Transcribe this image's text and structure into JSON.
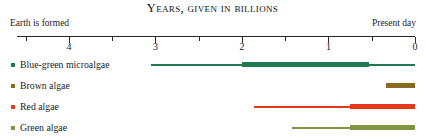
{
  "chart_data": {
    "type": "bar",
    "title": "Years, given in billions",
    "subtitle": "",
    "xlabel": "",
    "ylabel": "",
    "orientation": "horizontal-timeline",
    "xlim": [
      4.6,
      0
    ],
    "x_direction": "reversed",
    "grid": false,
    "legend_position": "left",
    "axis": {
      "left_caption": "Earth is formed",
      "right_caption": "Present day",
      "major_ticks": [
        4,
        3,
        2,
        1,
        0
      ],
      "major_tick_labels": [
        "4",
        "3",
        "2",
        "1",
        "0"
      ],
      "minor_ticks": [
        4.5,
        3.5,
        2.5,
        1.5,
        0.5
      ],
      "units": "billions of years ago"
    },
    "categories": [
      "Blue-green microalgae",
      "Brown algae",
      "Red algae",
      "Green algae"
    ],
    "series": [
      {
        "name": "possible range",
        "style": "thin",
        "values": [
          {
            "category": "Blue-green microalgae",
            "start": 3.05,
            "end": 0.0
          },
          {
            "category": "Brown algae",
            "start": null,
            "end": null
          },
          {
            "category": "Red algae",
            "start": 1.86,
            "end": 0.0
          },
          {
            "category": "Green algae",
            "start": 1.42,
            "end": 0.0
          }
        ]
      },
      {
        "name": "confirmed range",
        "style": "thick",
        "values": [
          {
            "category": "Blue-green microalgae",
            "start": 2.0,
            "end": 0.53
          },
          {
            "category": "Brown algae",
            "start": 0.33,
            "end": 0.0
          },
          {
            "category": "Red algae",
            "start": 0.75,
            "end": 0.0
          },
          {
            "category": "Green algae",
            "start": 0.75,
            "end": 0.0
          }
        ]
      }
    ],
    "colors": {
      "blue_green_microalgae": "#1f7a52",
      "brown_algae": "#8a6a21",
      "red_algae": "#e8381a",
      "green_algae": "#7f9540",
      "axis": "#2a2a2a",
      "text": "#1c1c1c"
    }
  },
  "title": "Years, given in billions",
  "axis": {
    "left_caption": "Earth is formed",
    "right_caption": "Present day",
    "labels": {
      "t4": "4",
      "t3": "3",
      "t2": "2",
      "t1": "1",
      "t0": "0"
    }
  },
  "rows": [
    {
      "label": "Blue-green microalgae",
      "color": "#1f7a52",
      "bullet": "legend-bullet-blue-green-microalgae"
    },
    {
      "label": "Brown algae",
      "color": "#8a6a21",
      "bullet": "legend-bullet-brown-algae"
    },
    {
      "label": "Red algae",
      "color": "#e8381a",
      "bullet": "legend-bullet-red-algae"
    },
    {
      "label": "Green algae",
      "color": "#7f9540",
      "bullet": "legend-bullet-green-algae"
    }
  ]
}
